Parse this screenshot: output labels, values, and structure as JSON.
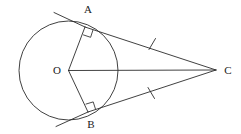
{
  "figure": {
    "kind": "geometry-diagram",
    "background_color": "#ffffff",
    "stroke_color": "#2b2b2b",
    "label_color": "#1a1a1a"
  },
  "labels": {
    "center": "O",
    "tangent_point_upper": "A",
    "tangent_point_lower": "B",
    "external_point": "C"
  },
  "label_positions": {
    "center": {
      "x": 57,
      "y": 74
    },
    "tangent_point_upper": {
      "x": 88,
      "y": 13
    },
    "tangent_point_lower": {
      "x": 91,
      "y": 128
    },
    "external_point": {
      "x": 228,
      "y": 74
    }
  },
  "geometry": {
    "circle": {
      "cx": 68.5,
      "cy": 70.5,
      "r": 49.5
    },
    "points": {
      "O": {
        "x": 68.5,
        "y": 70.5
      },
      "A": {
        "x": 85.0,
        "y": 27.0
      },
      "B": {
        "x": 88.0,
        "y": 112.0
      },
      "C": {
        "x": 216.0,
        "y": 70.0
      }
    },
    "segments": [
      {
        "name": "radius-OA",
        "from": "O",
        "to": "A"
      },
      {
        "name": "radius-OB",
        "from": "O",
        "to": "B"
      },
      {
        "name": "center-line-OC",
        "from": "O",
        "to": "C"
      },
      {
        "name": "tangent-AC",
        "from": "A",
        "to": "C"
      },
      {
        "name": "tangent-BC",
        "from": "B",
        "to": "C"
      }
    ],
    "tangent_extensions": [
      {
        "name": "tangent-extension-past-A",
        "from": {
          "x": 54.0,
          "y": 12.5
        },
        "to": {
          "x": 85.0,
          "y": 27.0
        }
      },
      {
        "name": "tangent-extension-past-B",
        "from": {
          "x": 56.0,
          "y": 126.5
        },
        "to": {
          "x": 88.0,
          "y": 112.0
        }
      }
    ],
    "right_angles": [
      {
        "name": "right-angle-at-A",
        "at": "A",
        "marker": "square",
        "size": 8
      },
      {
        "name": "right-angle-at-B",
        "at": "B",
        "marker": "square",
        "size": 8
      }
    ],
    "congruence_ticks": [
      {
        "name": "tick-on-AC",
        "x": 152,
        "y": 44,
        "segment": "tangent-AC",
        "count": 1
      },
      {
        "name": "tick-on-BC",
        "x": 151,
        "y": 93,
        "segment": "tangent-BC",
        "count": 1
      }
    ]
  }
}
